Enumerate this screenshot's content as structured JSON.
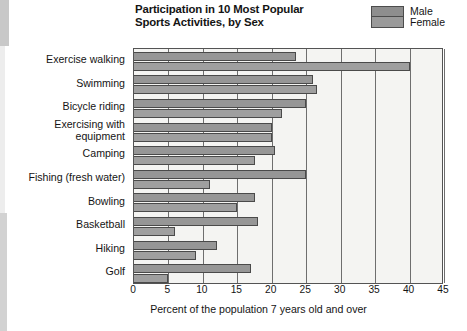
{
  "chart_data": {
    "type": "bar",
    "orientation": "horizontal",
    "title": "Participation in 10 Most Popular Sports Activities, by Sex",
    "title_line1": "Participation in 10 Most Popular",
    "title_line2": "Sports Activities, by Sex",
    "xlabel": "Percent of the population 7 years old and over",
    "ylabel": "",
    "xlim": [
      0,
      45
    ],
    "xticks": [
      0,
      5,
      10,
      15,
      20,
      25,
      30,
      35,
      40,
      45
    ],
    "xtick_labels": [
      "0",
      "5",
      "10",
      "15",
      "20",
      "25",
      "30",
      "35",
      "40",
      "45"
    ],
    "grid": true,
    "grid_axis": "x",
    "legend_position": "top-right",
    "categories": [
      "Exercise walking",
      "Swimming",
      "Bicycle riding",
      "Exercising with equipment",
      "Camping",
      "Fishing (fresh water)",
      "Bowling",
      "Basketball",
      "Hiking",
      "Golf"
    ],
    "series": [
      {
        "name": "Male",
        "color": "#969696",
        "values": [
          23.5,
          26.0,
          25.0,
          20.0,
          20.5,
          25.0,
          17.5,
          18.0,
          12.0,
          17.0
        ]
      },
      {
        "name": "Female",
        "color": "#9f9f9f",
        "values": [
          40.0,
          26.5,
          21.5,
          20.0,
          17.5,
          11.0,
          15.0,
          6.0,
          9.0,
          5.0
        ]
      }
    ]
  },
  "legend": {
    "entries": [
      {
        "label": "Male",
        "color": "#8e8e8e"
      },
      {
        "label": "Female",
        "color": "#9a9a9a"
      }
    ]
  },
  "colors": {
    "plot_background": "#f4f4f2",
    "axis": "#545454",
    "gridline": "#6e6e6e",
    "text": "#141414"
  }
}
